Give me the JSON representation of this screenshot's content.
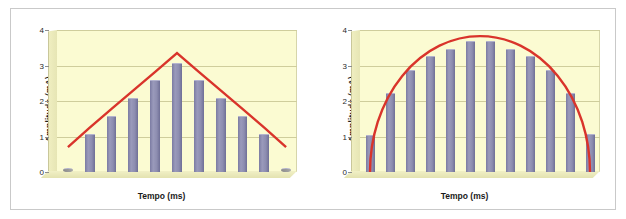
{
  "figure": {
    "background": "#ffffff",
    "border_color": "#c9c9c9",
    "plot_background": "#fbfbd2",
    "bar_color": "#8b8bad",
    "line_color": "#d9342b",
    "grid_color": "#cfcd9c"
  },
  "chart_data": [
    {
      "type": "bar",
      "title": "",
      "xlabel": "Tempo (ms)",
      "ylabel": "Amplitude (mA)",
      "ylim": [
        0,
        4
      ],
      "yticks": [
        0,
        1,
        2,
        3,
        4
      ],
      "ytick_labels": [
        "0",
        "1",
        "2",
        "3",
        "4"
      ],
      "grid": true,
      "legend": "none",
      "categories": [
        "1",
        "2",
        "3",
        "4",
        "5",
        "6",
        "7",
        "8",
        "9",
        "10",
        "11"
      ],
      "values": [
        0,
        1.05,
        1.55,
        2.05,
        2.55,
        3.05,
        2.55,
        2.05,
        1.55,
        1.05,
        0
      ],
      "series": [
        {
          "name": "Amplitude",
          "type": "bar",
          "values": [
            0,
            1.05,
            1.55,
            2.05,
            2.55,
            3.05,
            2.55,
            2.05,
            1.55,
            1.05,
            0
          ]
        },
        {
          "name": "Envoltoria triangular",
          "type": "line",
          "color": "#d9342b",
          "values": [
            0.7,
            1.25,
            1.78,
            2.3,
            2.82,
            3.35,
            2.82,
            2.3,
            1.78,
            1.25,
            0.7
          ]
        }
      ],
      "annotations": [
        "envelope is a triangular (linear rise and fall) curve peaking at ~3.35 mA"
      ]
    },
    {
      "type": "bar",
      "title": "",
      "xlabel": "Tempo (ms)",
      "ylabel": "Amplitude (mA)",
      "ylim": [
        0,
        4
      ],
      "yticks": [
        0,
        1,
        2,
        3,
        4
      ],
      "ytick_labels": [
        "0",
        "1",
        "2",
        "3",
        "4"
      ],
      "grid": true,
      "legend": "none",
      "categories": [
        "1",
        "2",
        "3",
        "4",
        "5",
        "6",
        "7",
        "8",
        "9",
        "10",
        "11",
        "12"
      ],
      "values": [
        1.02,
        2.2,
        2.85,
        3.25,
        3.45,
        3.65,
        3.65,
        3.45,
        3.25,
        2.85,
        2.2,
        1.05
      ],
      "series": [
        {
          "name": "Amplitude",
          "type": "bar",
          "values": [
            1.02,
            2.2,
            2.85,
            3.25,
            3.45,
            3.65,
            3.65,
            3.45,
            3.25,
            2.85,
            2.2,
            1.05
          ]
        },
        {
          "name": "Envoltoria semicircular",
          "type": "line",
          "color": "#d9342b",
          "values": [
            0.0,
            2.55,
            3.25,
            3.6,
            3.78,
            3.83,
            3.83,
            3.78,
            3.6,
            3.25,
            2.55,
            0.0
          ]
        }
      ],
      "annotations": [
        "envelope is a semicircular (dome) curve peaking at ~3.83 mA"
      ]
    }
  ],
  "panels": {
    "left": {
      "name": "triangular-ramp-chart",
      "xlabel": "Tempo (ms)",
      "ylabel": "Amplitude (mA)",
      "yticks": [
        "4",
        "3",
        "2",
        "1",
        "0"
      ]
    },
    "right": {
      "name": "semicircular-envelope-chart",
      "xlabel": "Tempo (ms)",
      "ylabel": "Amplitude (mA)",
      "yticks": [
        "4",
        "3",
        "2",
        "1",
        "0"
      ]
    }
  }
}
